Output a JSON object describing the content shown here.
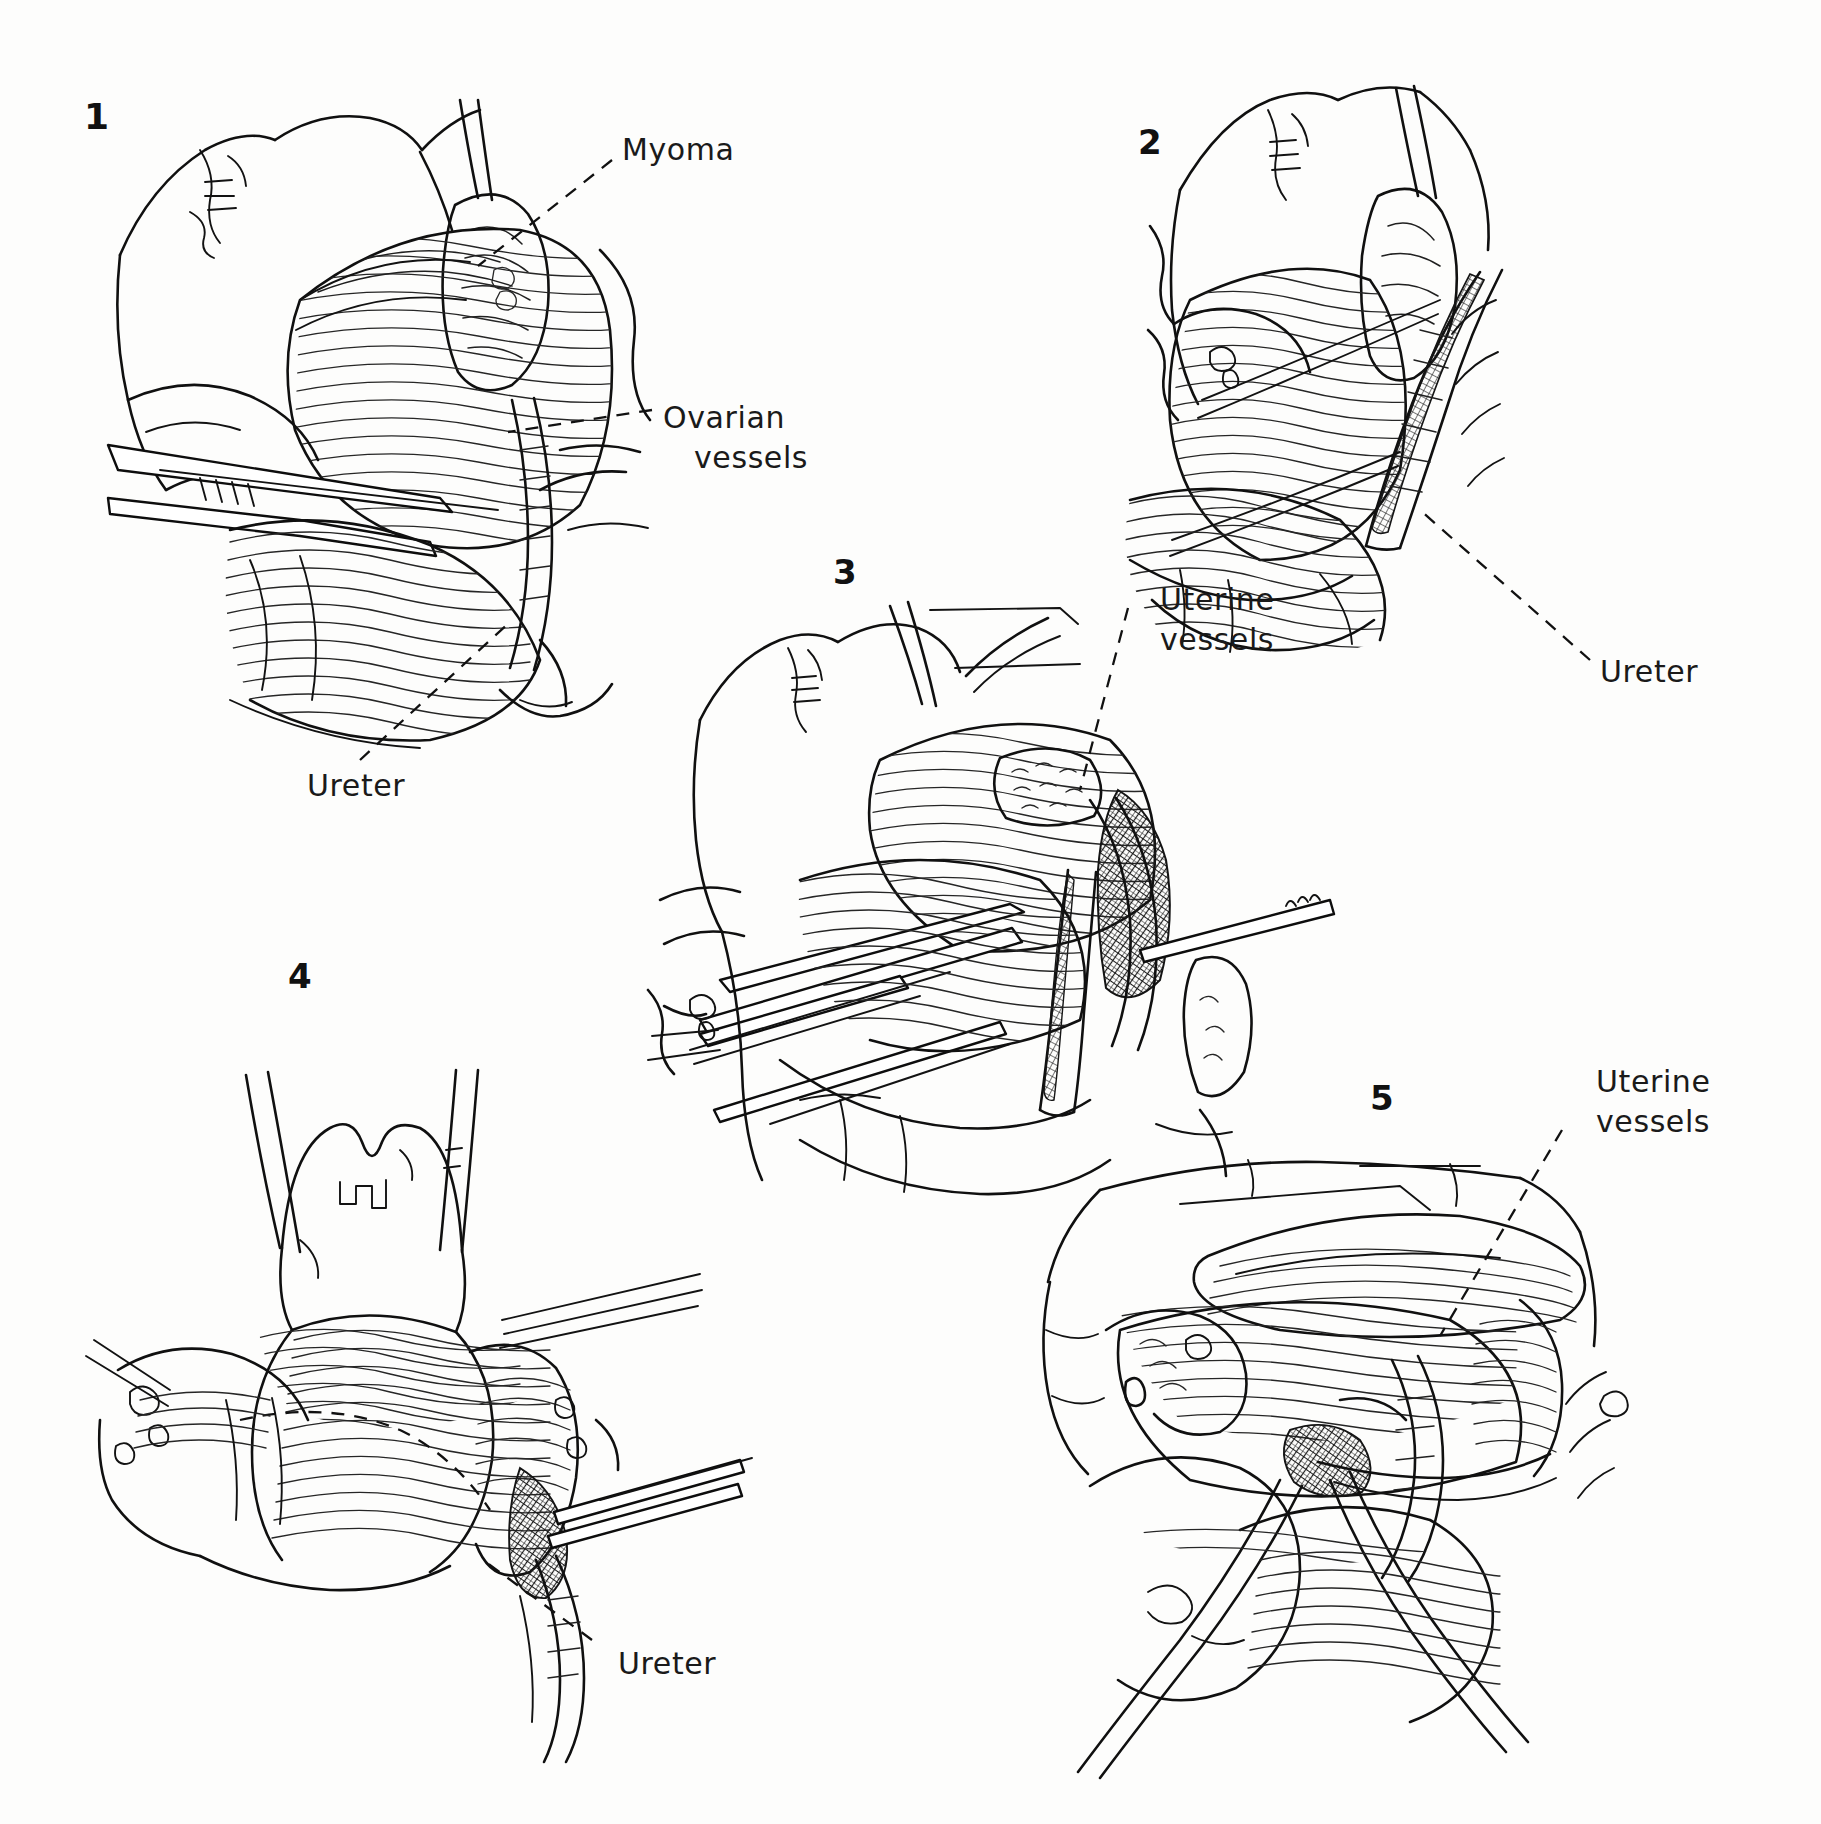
{
  "figure": {
    "kind": "surgical-procedure-illustration",
    "background_color": "#ffffff",
    "ink_color": "#141414",
    "panel_count": 5
  },
  "panels": [
    {
      "id": "panel-1",
      "number": "1",
      "number_pos": {
        "x": 84,
        "y": 105
      },
      "labels": [
        {
          "name": "myoma",
          "text": "Myoma",
          "x": 622,
          "y": 138,
          "lines": [
            "Myoma"
          ]
        },
        {
          "name": "ovarian-vessels",
          "text": "Ovarian vessels",
          "x": 663,
          "y": 400,
          "lines": [
            "Ovarian",
            "vessels"
          ]
        },
        {
          "name": "ureter",
          "text": "Ureter",
          "x": 307,
          "y": 770,
          "lines": [
            "Ureter"
          ]
        }
      ]
    },
    {
      "id": "panel-2",
      "number": "2",
      "number_pos": {
        "x": 1138,
        "y": 128
      },
      "labels": [
        {
          "name": "ureter",
          "text": "Ureter",
          "x": 1600,
          "y": 656,
          "lines": [
            "Ureter"
          ]
        }
      ]
    },
    {
      "id": "panel-3",
      "number": "3",
      "number_pos": {
        "x": 833,
        "y": 558
      },
      "labels": [
        {
          "name": "uterine-vessels",
          "text": "Uterine vessels",
          "x": 1135,
          "y": 580,
          "lines": [
            "Uterine",
            "vessels"
          ]
        }
      ]
    },
    {
      "id": "panel-4",
      "number": "4",
      "number_pos": {
        "x": 288,
        "y": 962
      },
      "labels": [
        {
          "name": "ureter",
          "text": "Ureter",
          "x": 618,
          "y": 1648,
          "lines": [
            "Ureter"
          ]
        }
      ]
    },
    {
      "id": "panel-5",
      "number": "5",
      "number_pos": {
        "x": 1370,
        "y": 1084
      },
      "labels": [
        {
          "name": "uterine-vessels",
          "text": "Uterine vessels",
          "x": 1570,
          "y": 1068,
          "lines": [
            "Uterine",
            "vessels"
          ]
        }
      ]
    }
  ],
  "anatomy_terms": [
    "Myoma",
    "Ovarian vessels",
    "Ureter",
    "Uterine vessels"
  ]
}
